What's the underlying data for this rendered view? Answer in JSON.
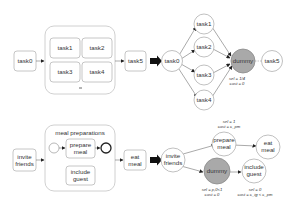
{
  "top": {
    "bpmn": {
      "start_task": "task0",
      "parallel_tasks": [
        "task1",
        "task2",
        "task3",
        "task4"
      ],
      "end_task": "task5"
    },
    "graph": {
      "source": "task0",
      "branches": [
        "task1",
        "task2",
        "task3",
        "task4"
      ],
      "dummy": "dummy",
      "sink": "task5",
      "dummy_annotation": {
        "sel": "sel = 1/4",
        "cost": "cost = 0"
      }
    }
  },
  "bottom": {
    "bpmn": {
      "start_task": "invite friends",
      "subprocess_title": "meal preparations",
      "task_a": "prepare meal",
      "task_b": "include guest",
      "end_task": "eat meal"
    },
    "graph": {
      "source": "invite friends",
      "prepare": "prepare meal",
      "dummy": "dummy",
      "include": "include guest",
      "sink": "eat meal",
      "prepare_annotation": {
        "sel": "sel = 1",
        "cost": "cost = c_pm"
      },
      "dummy_annotation": {
        "sel": "sel = p,0<1",
        "cost": "cost = 0"
      },
      "include_annotation": {
        "sel": "sel = 0",
        "cost": "cost = c_ig < c_pm"
      }
    }
  },
  "colors": {
    "dummy_fill": "#a9a9a9",
    "border": "#b8b8b8",
    "arrow": "#111111"
  }
}
